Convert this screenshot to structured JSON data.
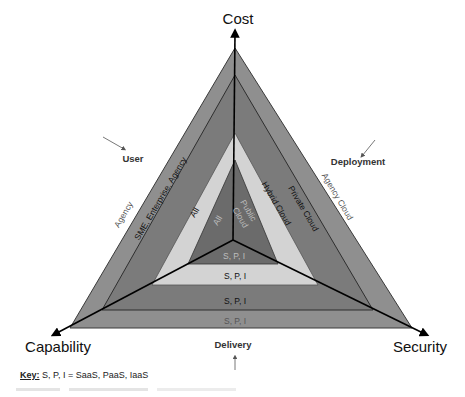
{
  "axes": {
    "top": "Cost",
    "left": "Capability",
    "right": "Security"
  },
  "groups": {
    "user": "User",
    "deployment": "Deployment",
    "delivery": "Delivery"
  },
  "layers": [
    {
      "level": 1,
      "color": "#8f8f8f",
      "user": "Agency",
      "deployment": "Agency Cloud",
      "delivery": "S, P, I"
    },
    {
      "level": 2,
      "color": "#7b7b7b",
      "user": "SME, Enterprise, Agency",
      "deployment": "Private Cloud",
      "delivery": "S, P, I"
    },
    {
      "level": 3,
      "color": "#d3d3d3",
      "user": "All",
      "deployment": "Hybrid Cloud",
      "delivery": "S, P, I"
    },
    {
      "level": 4,
      "color": "#6b6b6b",
      "user": "All",
      "deployment_line1": "Public",
      "deployment_line2": "Cloud",
      "delivery": "S, P, I"
    }
  ],
  "key": {
    "label": "Key:",
    "text": "S, P, I = SaaS, PaaS, IaaS"
  }
}
